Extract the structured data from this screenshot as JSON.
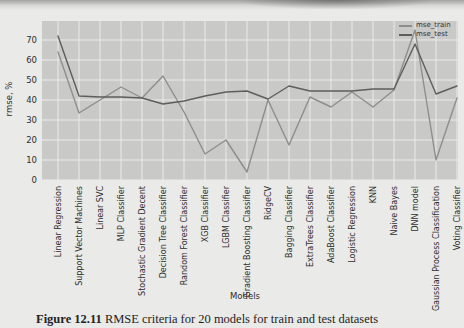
{
  "figure": {
    "caption_label": "Figure 12.11",
    "caption_text": "RMSE criteria for 20 models for train and test datasets"
  },
  "chart_data": {
    "type": "line",
    "title": "",
    "xlabel": "Models",
    "ylabel": "rmse, %",
    "ylim": [
      0,
      78
    ],
    "yticks": [
      0,
      10,
      20,
      30,
      40,
      50,
      60,
      70
    ],
    "grid": true,
    "legend_position": "top-right",
    "plot_bg_color": "#c9c9c7",
    "gridline_color": "#edebe9",
    "categories": [
      "Linear Regression",
      "Support Vector Machines",
      "Linear SVC",
      "MLP Classifier",
      "Stochastic Gradient Decent",
      "Decision Tree Classifier",
      "Random Forest Classifier",
      "XGB Classifier",
      "LGBM Classifier",
      "Gradient Boosting Classifier",
      "RidgeCV",
      "Bagging Classifier",
      "ExtraTrees Classifier",
      "AdaBoost Classifier",
      "Logistic Regression",
      "KNN",
      "Naive Bayes",
      "DNN model",
      "Gaussian Process Classification",
      "Voting Classifier"
    ],
    "series": [
      {
        "name": "mse_train",
        "color": "#8e8e8c",
        "values": [
          64,
          33.5,
          40,
          46.5,
          41,
          52,
          34,
          13,
          20,
          4,
          40,
          17.5,
          41.5,
          36.5,
          44,
          36.5,
          45,
          75,
          10,
          41
        ]
      },
      {
        "name": "mse_test",
        "color": "#5e5e5c",
        "values": [
          72,
          42,
          41.5,
          41.5,
          41,
          38,
          39.5,
          42,
          44,
          44.5,
          40.5,
          47,
          44.5,
          44.5,
          44.5,
          45.5,
          45.5,
          68,
          43,
          47
        ]
      }
    ]
  }
}
